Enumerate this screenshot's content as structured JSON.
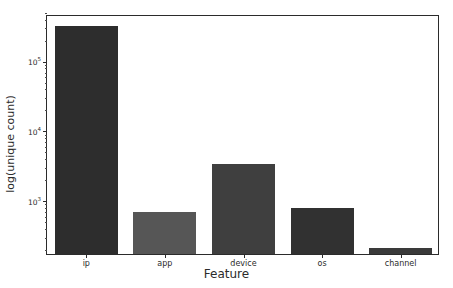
{
  "chart_data": {
    "type": "bar",
    "title": "",
    "xlabel": "Feature",
    "ylabel": "log(unique count)",
    "yscale": "log",
    "ylim": [
      180,
      500000
    ],
    "grid": false,
    "legend": null,
    "categories": [
      "ip",
      "app",
      "device",
      "os",
      "channel"
    ],
    "values": [
      333168,
      716,
      3548,
      820,
      223
    ],
    "ytick_labels": [
      "10³",
      "10⁴",
      "10⁵"
    ],
    "ytick_values": [
      1000,
      10000,
      100000
    ],
    "bar_colors": [
      "#2d2d2d",
      "#565656",
      "#3f3f3f",
      "#313131",
      "#3a3a3a"
    ],
    "series": [
      {
        "name": "unique count",
        "values": [
          333168,
          716,
          3548,
          820,
          223
        ]
      }
    ]
  },
  "axes": {
    "x_title": "Feature",
    "y_title": "log(unique count)",
    "y_ticks": [
      {
        "label_base": "10",
        "label_exp": "3",
        "value": 1000
      },
      {
        "label_base": "10",
        "label_exp": "4",
        "value": 10000
      },
      {
        "label_base": "10",
        "label_exp": "5",
        "value": 100000
      }
    ],
    "x_ticks": [
      {
        "label": "ip"
      },
      {
        "label": "app"
      },
      {
        "label": "device"
      },
      {
        "label": "os"
      },
      {
        "label": "channel"
      }
    ]
  },
  "colors": {
    "background": "#ffffff",
    "axis": "#2b2b2b",
    "text": "#2b2b2b"
  }
}
